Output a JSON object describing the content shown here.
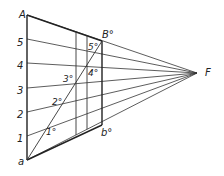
{
  "figure": {
    "type": "perspective-construction",
    "stroke_color": "#222222",
    "vanishing_point": {
      "label": "F",
      "x": 197,
      "y": 73
    },
    "left_edge": {
      "top_label": "A",
      "bottom_label": "a",
      "x": 27,
      "y_top": 15,
      "y_bottom": 160
    },
    "right_edge": {
      "top_label": "B°",
      "bottom_label": "b°",
      "x": 102,
      "y_top": 41,
      "y_bottom": 125
    },
    "interior_verticals": [
      76,
      87
    ],
    "division_labels": [
      "1",
      "2",
      "3",
      "4",
      "5"
    ],
    "division_y": [
      136,
      112,
      88,
      63,
      39
    ],
    "point_labels": [
      "1°",
      "2°",
      "3°",
      "4°",
      "5°"
    ]
  }
}
